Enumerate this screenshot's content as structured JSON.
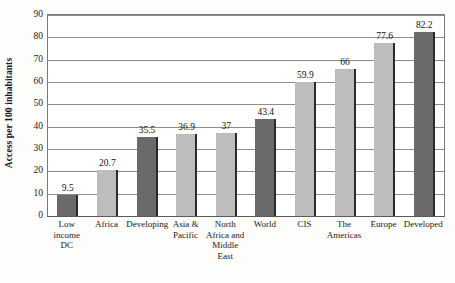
{
  "chart_data": {
    "type": "bar",
    "title": "",
    "subtitle": "",
    "xlabel": "",
    "ylabel": "Access per 100 inhabitants",
    "ylim": [
      0,
      90
    ],
    "ytick_step": 10,
    "yticks": [
      "0",
      "10",
      "20",
      "30",
      "40",
      "50",
      "60",
      "70",
      "80",
      "90"
    ],
    "grid": "horizontal",
    "legend": "none",
    "categories": [
      "Low income DC",
      "Africa",
      "Developing",
      "Asia & Pacific",
      "North Africa and Middle East",
      "World",
      "CIS",
      "The Americas",
      "Europe",
      "Developed"
    ],
    "category_lines": [
      [
        "Low",
        "income DC"
      ],
      [
        "Africa"
      ],
      [
        "Developing"
      ],
      [
        "Asia &",
        "Pacific"
      ],
      [
        "North",
        "Africa and",
        "Middle",
        "East"
      ],
      [
        "World"
      ],
      [
        "CIS"
      ],
      [
        "The",
        "Americas"
      ],
      [
        "Europe"
      ],
      [
        "Developed"
      ]
    ],
    "values": [
      9.5,
      20.7,
      35.5,
      36.9,
      37,
      43.4,
      59.9,
      66,
      77.6,
      82.2
    ],
    "value_labels": [
      "9.5",
      "20.7",
      "35.5",
      "36.9",
      "37",
      "43.4",
      "59.9",
      "66",
      "77.6",
      "82.2"
    ],
    "bar_shades": [
      "dark",
      "light",
      "dark",
      "light",
      "light",
      "dark",
      "light",
      "light",
      "light",
      "dark"
    ]
  },
  "colors": {
    "bar_dark": "#6a6a6a",
    "bar_light": "#bdbdbd",
    "bar_edge": "#2b2b2b",
    "gridline": "#8c8c8c",
    "axis": "#5a5a5a",
    "plot_background": "#ffffff",
    "page_background": "#fdfdfb",
    "text": "#1a1a1a"
  }
}
